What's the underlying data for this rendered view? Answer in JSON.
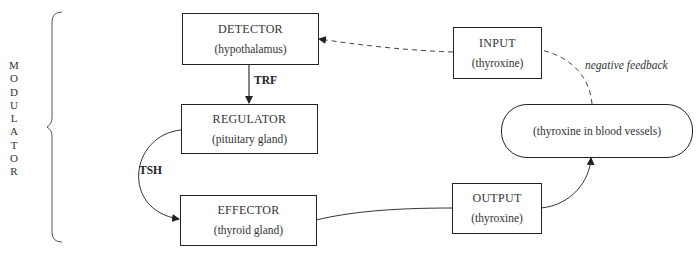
{
  "modulator": {
    "label": "MODULATOR",
    "letters": [
      "M",
      "O",
      "D",
      "U",
      "L",
      "A",
      "T",
      "O",
      "R"
    ]
  },
  "nodes": {
    "detector": {
      "title": "DETECTOR",
      "subtitle": "(hypothalamus)"
    },
    "regulator": {
      "title": "REGULATOR",
      "subtitle": "(pituitary gland)"
    },
    "effector": {
      "title": "EFFECTOR",
      "subtitle": "(thyroid gland)"
    },
    "input": {
      "title": "INPUT",
      "subtitle": "(thyroxine)"
    },
    "output": {
      "title": "OUTPUT",
      "subtitle": "(thyroxine)"
    },
    "blood": {
      "subtitle": "(thyroxine in blood vessels)"
    }
  },
  "edges": {
    "trf": "TRF",
    "tsh": "TSH",
    "negative_feedback": "negative feedback"
  },
  "colors": {
    "line": "#222222",
    "text": "#333333",
    "background": "#ffffff"
  }
}
